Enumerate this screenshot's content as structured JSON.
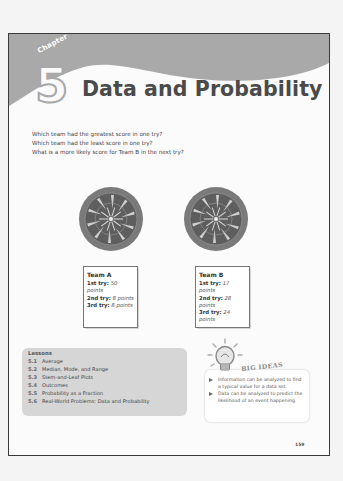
{
  "chapter": {
    "label": "Chapter",
    "number": "5",
    "title": "Data and Probability"
  },
  "questions": [
    "Which team had the greatest score in one try?",
    "Which team had the least score in one try?",
    "What is a more likely score for Team B in the next try?"
  ],
  "teams": [
    {
      "name": "Team A",
      "tries": [
        {
          "label": "1st try:",
          "value": "50 points"
        },
        {
          "label": "2nd try:",
          "value": "8 points"
        },
        {
          "label": "3rd try:",
          "value": "8 points"
        }
      ]
    },
    {
      "name": "Team B",
      "tries": [
        {
          "label": "1st try:",
          "value": "17 points"
        },
        {
          "label": "2nd try:",
          "value": "28 points"
        },
        {
          "label": "3rd try:",
          "value": "24 points"
        }
      ]
    }
  ],
  "lessons": {
    "heading": "Lessons",
    "items": [
      {
        "num": "5.1",
        "title": "Average"
      },
      {
        "num": "5.2",
        "title": "Median, Mode, and Range"
      },
      {
        "num": "5.3",
        "title": "Stem-and-Leaf Plots"
      },
      {
        "num": "5.4",
        "title": "Outcomes"
      },
      {
        "num": "5.5",
        "title": "Probability as a Fraction"
      },
      {
        "num": "5.6",
        "title": "Real-World Problems: Data and Probability"
      }
    ]
  },
  "big_ideas": {
    "title": "BIG IDEAS",
    "items": [
      "Information can be analyzed to find a typical value for a data set.",
      "Data can be analyzed to predict the likelihood of an event happening."
    ]
  },
  "page_number": "159",
  "colors": {
    "header_gray": "#a9a9a9",
    "lessons_bg": "#d6d6d6",
    "page_border": "#3a3a3a"
  }
}
